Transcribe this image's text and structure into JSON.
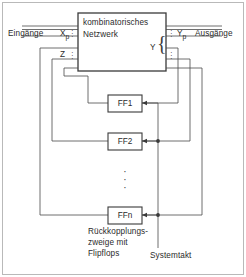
{
  "diagram": {
    "title_block": {
      "line1": "kombinatorisches",
      "line2": "Netzwerk"
    },
    "labels": {
      "inputs": "Eingänge",
      "outputs": "Ausgänge",
      "input_signal": "X",
      "input_signal_sub": "p",
      "output_signal": "Y",
      "output_signal_sub": "p",
      "state_signal": "Z",
      "output_bundle": "Y",
      "feedback_line1": "Rückkopplungs-",
      "feedback_line2": "zweige mit",
      "feedback_line3": "Flipflops",
      "clock": "Systemtakt"
    },
    "flipflops": [
      {
        "name": "FF1"
      },
      {
        "name": "FF2"
      },
      {
        "name": "FFn"
      }
    ],
    "ellipsis_glyph": "·",
    "colors": {
      "line": "#4a4a4a",
      "text": "#2b2b2b",
      "border": "#b9b9b9",
      "background": "#ffffff"
    }
  }
}
